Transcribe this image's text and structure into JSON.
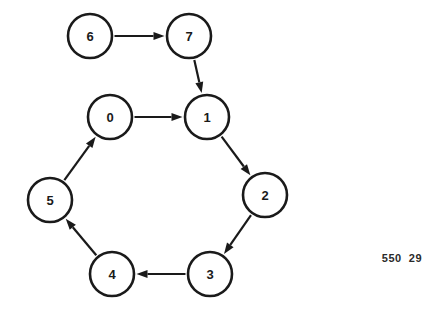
{
  "diagram": {
    "type": "directed-graph",
    "title": "",
    "background_color": "#ffffff",
    "node_stroke_color": "#1a1a1a",
    "node_fill_color": "#ffffff",
    "edge_color": "#1a1a1a",
    "nodes": [
      {
        "id": "0",
        "label": "0",
        "cx": 110,
        "cy": 117,
        "r": 22
      },
      {
        "id": "1",
        "label": "1",
        "cx": 207,
        "cy": 117,
        "r": 22
      },
      {
        "id": "2",
        "label": "2",
        "cx": 265,
        "cy": 195,
        "r": 22
      },
      {
        "id": "3",
        "label": "3",
        "cx": 210,
        "cy": 274,
        "r": 22
      },
      {
        "id": "4",
        "label": "4",
        "cx": 112,
        "cy": 274,
        "r": 22
      },
      {
        "id": "5",
        "label": "5",
        "cx": 50,
        "cy": 200,
        "r": 22
      },
      {
        "id": "6",
        "label": "6",
        "cx": 90,
        "cy": 36,
        "r": 22
      },
      {
        "id": "7",
        "label": "7",
        "cx": 189,
        "cy": 36,
        "r": 22
      }
    ],
    "edges": [
      {
        "from": "6",
        "to": "7",
        "directed": true
      },
      {
        "from": "7",
        "to": "1",
        "directed": true
      },
      {
        "from": "0",
        "to": "1",
        "directed": true
      },
      {
        "from": "1",
        "to": "2",
        "directed": true
      },
      {
        "from": "2",
        "to": "3",
        "directed": true
      },
      {
        "from": "3",
        "to": "4",
        "directed": true
      },
      {
        "from": "4",
        "to": "5",
        "directed": true
      },
      {
        "from": "5",
        "to": "0",
        "directed": true
      }
    ]
  },
  "annotations": {
    "corner_code": "550  29"
  }
}
